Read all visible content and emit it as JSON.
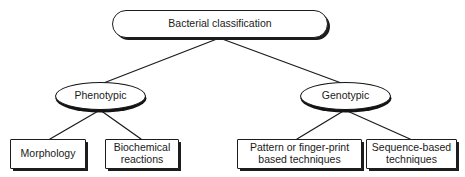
{
  "diagram": {
    "type": "tree",
    "colors": {
      "stroke": "#1c1c1c",
      "fill": "#ffffff",
      "text": "#1a1a1a",
      "shadow": "#1c1c1c"
    },
    "nodes": {
      "root": {
        "label": "Bacterial classification",
        "shape": "stadium",
        "level": 0
      },
      "phenotypic": {
        "label": "Phenotypic",
        "shape": "ellipse",
        "level": 1
      },
      "genotypic": {
        "label": "Genotypic",
        "shape": "ellipse",
        "level": 1
      },
      "morphology": {
        "label": "Morphology",
        "shape": "rectangle",
        "level": 2
      },
      "biochemical_reactions": {
        "label": "Biochemical\nreactions",
        "shape": "rectangle",
        "level": 2
      },
      "pattern_techniques": {
        "label": "Pattern or finger-print\nbased techniques",
        "shape": "rectangle",
        "level": 2
      },
      "sequence_techniques": {
        "label": "Sequence-based\ntechniques",
        "shape": "rectangle",
        "level": 2
      }
    },
    "edges": [
      {
        "from": "root",
        "to": "phenotypic"
      },
      {
        "from": "root",
        "to": "genotypic"
      },
      {
        "from": "phenotypic",
        "to": "morphology"
      },
      {
        "from": "phenotypic",
        "to": "biochemical_reactions"
      },
      {
        "from": "genotypic",
        "to": "pattern_techniques"
      },
      {
        "from": "genotypic",
        "to": "sequence_techniques"
      }
    ]
  }
}
